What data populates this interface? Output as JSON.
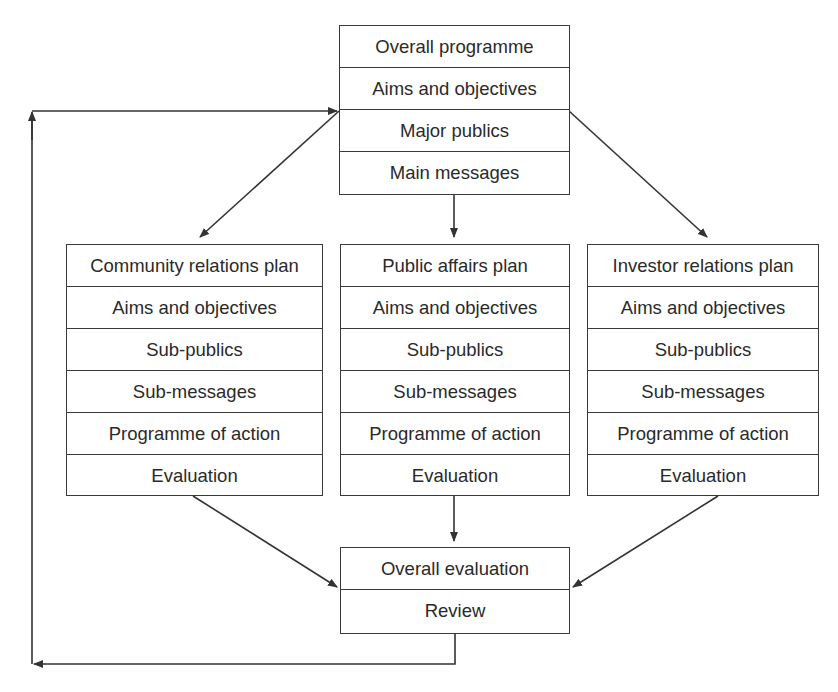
{
  "diagram": {
    "type": "flowchart",
    "top_box": {
      "rows": [
        "Overall programme",
        "Aims and objectives",
        "Major publics",
        "Main messages"
      ]
    },
    "plans": [
      {
        "rows": [
          "Community relations plan",
          "Aims and objectives",
          "Sub-publics",
          "Sub-messages",
          "Programme of action",
          "Evaluation"
        ]
      },
      {
        "rows": [
          "Public affairs plan",
          "Aims and objectives",
          "Sub-publics",
          "Sub-messages",
          "Programme of action",
          "Evaluation"
        ]
      },
      {
        "rows": [
          "Investor relations plan",
          "Aims and objectives",
          "Sub-publics",
          "Sub-messages",
          "Programme of action",
          "Evaluation"
        ]
      }
    ],
    "bottom_box": {
      "rows": [
        "Overall evaluation",
        "Review"
      ]
    },
    "edges": [
      {
        "from": "Overall programme",
        "to": "Community relations plan"
      },
      {
        "from": "Overall programme",
        "to": "Public affairs plan"
      },
      {
        "from": "Overall programme",
        "to": "Investor relations plan"
      },
      {
        "from": "Community relations plan",
        "to": "Overall evaluation"
      },
      {
        "from": "Public affairs plan",
        "to": "Overall evaluation"
      },
      {
        "from": "Investor relations plan",
        "to": "Overall evaluation"
      },
      {
        "from": "Review",
        "to": "Overall programme",
        "label": "feedback loop"
      }
    ],
    "colors": {
      "line": "#333333",
      "text": "#2a2a2a",
      "background": "#ffffff"
    }
  }
}
